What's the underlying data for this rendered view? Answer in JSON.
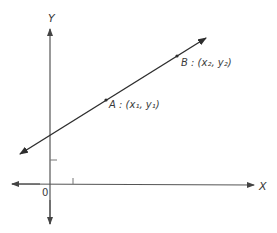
{
  "diagram": {
    "type": "coordinate-plane-line",
    "colors": {
      "axis": "#555555",
      "line": "#2e2e2e",
      "text": "#3a3a3a",
      "background": "#ffffff"
    },
    "axes": {
      "x_label": "X",
      "y_label": "Y",
      "origin_label": "0"
    },
    "points": [
      {
        "name": "A",
        "label": "A",
        "coord_text": "(x₁, y₁)",
        "x_sub": "1",
        "y_sub": "1"
      },
      {
        "name": "B",
        "label": "B",
        "coord_text": "(x₂, y₂)",
        "x_sub": "2",
        "y_sub": "2"
      }
    ],
    "point_labels": {
      "A": "A : (x₁, y₁)",
      "B": "B : (x₂, y₂)"
    }
  }
}
